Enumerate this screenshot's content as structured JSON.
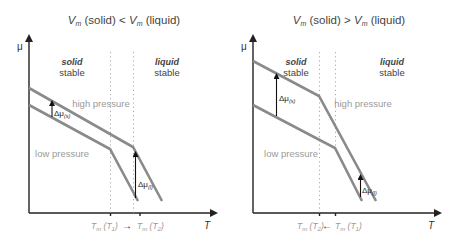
{
  "panels": [
    {
      "title_a": "V",
      "title_a_sub": "m",
      "title_mid": " (solid) < ",
      "title_b": "V",
      "title_b_sub": "m",
      "title_end": " (liquid)",
      "y_axis_label": "μ",
      "x_axis_label": "T",
      "solid_label_top": "solid",
      "solid_label_bottom": "stable",
      "liquid_label_top": "liquid",
      "liquid_label_bottom": "stable",
      "high_pressure_label": "high pressure",
      "low_pressure_label": "low pressure",
      "delta_solid": "Δμ",
      "delta_solid_sub": "(s)",
      "delta_liquid": "Δμ",
      "delta_liquid_sub": "(l)",
      "tick1_label": "T",
      "tick1_sub": "m",
      "tick1_paren": " (T",
      "tick1_paren_sub": "1",
      "tick1_close": ")",
      "tick_arrow": "→",
      "tick2_label": "T",
      "tick2_sub": "m",
      "tick2_paren": " (T",
      "tick2_paren_sub": "2",
      "tick2_close": ")"
    },
    {
      "title_a": "V",
      "title_a_sub": "m",
      "title_mid": " (solid) > ",
      "title_b": "V",
      "title_b_sub": "m",
      "title_end": " (liquid)",
      "y_axis_label": "μ",
      "x_axis_label": "T",
      "solid_label_top": "solid",
      "solid_label_bottom": "stable",
      "liquid_label_top": "liquid",
      "liquid_label_bottom": "stable",
      "high_pressure_label": "high pressure",
      "low_pressure_label": "low pressure",
      "delta_solid": "Δμ",
      "delta_solid_sub": "(s)",
      "delta_liquid": "Δμ",
      "delta_liquid_sub": "(l)",
      "tick1_label": "T",
      "tick1_sub": "m",
      "tick1_paren": " (T",
      "tick1_paren_sub": "2",
      "tick1_close": ")",
      "tick_arrow": "←",
      "tick2_label": "T",
      "tick2_sub": "m",
      "tick2_paren": " (T",
      "tick2_paren_sub": "1",
      "tick2_close": ")"
    }
  ],
  "colors": {
    "curve": "#8a8a8a",
    "axis": "#222222",
    "pressure_text": "#9a9a9a",
    "region_text": "#444444"
  }
}
